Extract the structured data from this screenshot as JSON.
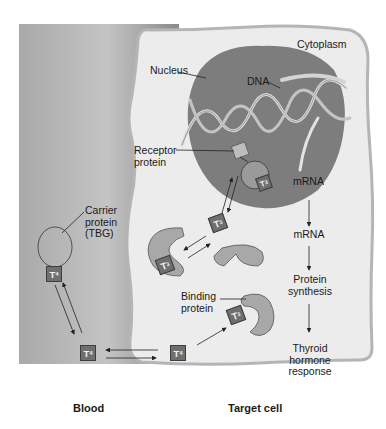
{
  "diagram": {
    "regions": {
      "blood": "Blood",
      "target_cell": "Target cell",
      "cytoplasm": "Cytoplasm",
      "nucleus": "Nucleus"
    },
    "labels": {
      "dna": "DNA",
      "receptor_protein": "Receptor\nprotein",
      "mrna_nucleus": "mRNA",
      "mrna_cytoplasm": "mRNA",
      "protein_synthesis": "Protein\nsynthesis",
      "thyroid_response": "Thyroid\nhormone\nresponse",
      "carrier_protein": "Carrier\nprotein\n(TBG)",
      "binding_protein": "Binding\nprotein"
    },
    "hormones": {
      "t4": {
        "main": "T",
        "sub": "4"
      },
      "t3": {
        "main": "T",
        "sub": "3"
      }
    },
    "colors": {
      "blood_dark": "#8c8c8c",
      "blood_light": "#c9c9c9",
      "cell_fill": "#ececec",
      "cell_border": "#b5b5b5",
      "nucleus_fill": "#7d7d7d",
      "protein_fill": "#a8a8a8",
      "hormone_box": "#6f6f6f"
    }
  }
}
